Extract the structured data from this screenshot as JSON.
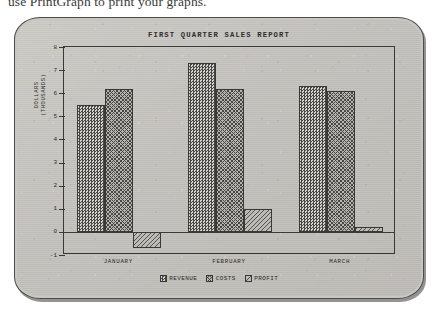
{
  "page": {
    "caption_text": "use PrintGraph to print your graphs."
  },
  "monitor": {
    "device_name": "crt-monitor"
  },
  "chart_data": {
    "type": "bar",
    "title": "FIRST QUARTER SALES REPORT",
    "xlabel": "",
    "ylabel": "DOLLARS\n(THOUSANDS)",
    "ylabel_line1": "DOLLARS",
    "ylabel_line2": "(THOUSANDS)",
    "categories": [
      "JANUARY",
      "FEBRUARY",
      "MARCH"
    ],
    "series": [
      {
        "name": "REVENUE",
        "values": [
          5.5,
          7.3,
          6.3
        ],
        "pattern": "dotted-checker"
      },
      {
        "name": "COSTS",
        "values": [
          6.2,
          6.2,
          6.1
        ],
        "pattern": "cross-hatch"
      },
      {
        "name": "PROFIT",
        "values": [
          -0.7,
          1.0,
          0.2
        ],
        "pattern": "diagonal-hatch"
      }
    ],
    "ylim": [
      -1,
      8
    ],
    "yticks": [
      8,
      7,
      6,
      5,
      4,
      3,
      2,
      1,
      0,
      -1
    ],
    "ytick_labels": [
      "8",
      "7",
      "6",
      "5",
      "4",
      "3",
      "2",
      "1",
      "0",
      "-1"
    ],
    "grid": false,
    "legend_position": "bottom-center",
    "zero_line": true
  },
  "colors": {
    "screen_background": "#c7c5c0",
    "bezel": "#c9c7c2",
    "ink": "#2e2c2b",
    "frame": "#3b3937"
  }
}
